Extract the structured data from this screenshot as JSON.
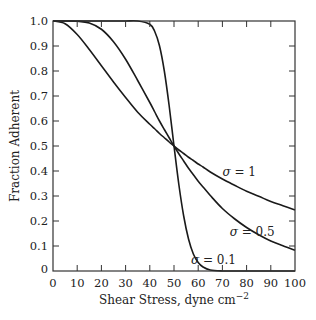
{
  "chart_data": {
    "type": "line",
    "title": "",
    "xlabel": "Shear Stress, dyne cm",
    "xlabel_superscript": "−2",
    "ylabel": "Fraction Adherent",
    "xlim": [
      0,
      100
    ],
    "ylim": [
      0,
      1.0
    ],
    "grid": false,
    "x_ticks": [
      0,
      10,
      20,
      30,
      40,
      50,
      60,
      70,
      80,
      90,
      100
    ],
    "x_tick_labels": [
      "0",
      "10",
      "20",
      "30",
      "40",
      "50",
      "60",
      "70",
      "80",
      "90",
      "100"
    ],
    "y_ticks": [
      0,
      0.1,
      0.2,
      0.3,
      0.4,
      0.5,
      0.6,
      0.7,
      0.8,
      0.9,
      1.0
    ],
    "y_tick_labels": [
      "0",
      "0.1",
      "0.2",
      "0.3",
      "0.4",
      "0.5",
      "0.6",
      "0.7",
      "0.8",
      "0.9",
      "1.0"
    ],
    "legend": null,
    "x": [
      0,
      5,
      10,
      15,
      20,
      25,
      30,
      35,
      40,
      42,
      44,
      46,
      48,
      50,
      52,
      54,
      56,
      58,
      60,
      62,
      65,
      70,
      75,
      80,
      85,
      90,
      95,
      100
    ],
    "series": [
      {
        "name": "σ = 1",
        "values": [
          1.0,
          0.989,
          0.946,
          0.886,
          0.821,
          0.756,
          0.694,
          0.635,
          0.587,
          0.569,
          0.55,
          0.533,
          0.516,
          0.5,
          0.484,
          0.47,
          0.455,
          0.442,
          0.428,
          0.416,
          0.396,
          0.368,
          0.343,
          0.319,
          0.299,
          0.278,
          0.261,
          0.244
        ]
      },
      {
        "name": "σ = 0.5",
        "values": [
          1.0,
          1.0,
          0.999,
          0.992,
          0.967,
          0.917,
          0.847,
          0.762,
          0.674,
          0.637,
          0.6,
          0.566,
          0.533,
          0.5,
          0.469,
          0.44,
          0.411,
          0.385,
          0.359,
          0.336,
          0.302,
          0.25,
          0.209,
          0.174,
          0.145,
          0.12,
          0.101,
          0.083
        ]
      },
      {
        "name": "σ = 0.1",
        "values": [
          1.0,
          1.0,
          1.0,
          1.0,
          1.0,
          1.0,
          1.0,
          1.0,
          0.987,
          0.959,
          0.901,
          0.8,
          0.661,
          0.5,
          0.346,
          0.22,
          0.128,
          0.068,
          0.034,
          0.016,
          0.004,
          0.0003,
          0.0,
          0.0,
          0.0,
          0.0,
          0.0,
          0.0
        ]
      }
    ],
    "annotations": [
      {
        "text": "σ = 1",
        "x": 70,
        "y": 0.38
      },
      {
        "text": "σ = 0.5",
        "x": 73,
        "y": 0.14
      },
      {
        "text": "σ = 0.1",
        "x": 57,
        "y": 0.03
      }
    ],
    "model_note": "Fraction adherent = 1 - Φ(ln(τ/50)/σ)"
  }
}
